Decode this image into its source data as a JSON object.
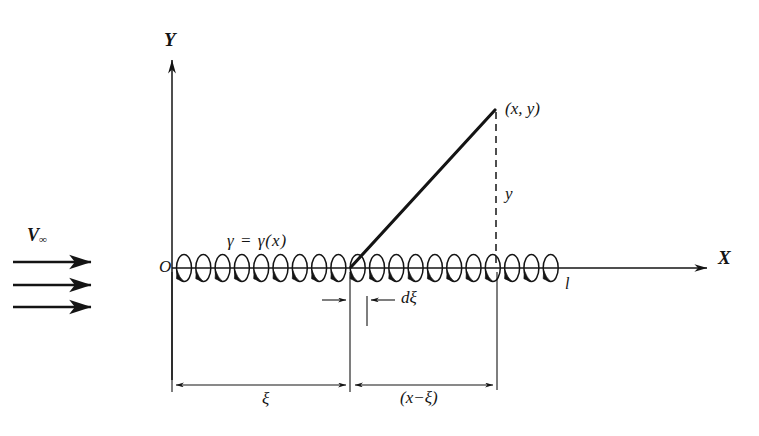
{
  "figure": {
    "type": "vortex-sheet-diagram",
    "background": "#ffffff",
    "ink": "#141414",
    "width": 759,
    "height": 436
  },
  "axes": {
    "x_label": "X",
    "y_label": "Y",
    "origin_label": "O",
    "x_axis": {
      "y": 268,
      "x_start": 172,
      "x_end": 712
    },
    "y_axis": {
      "x": 172,
      "y_start": 57,
      "y_end": 380
    }
  },
  "freestream": {
    "label": "V",
    "subscript": "∞",
    "arrow_count": 3,
    "arrows_y": [
      262,
      285,
      307
    ],
    "x_start": 13,
    "x_end": 97
  },
  "sheet": {
    "strength_label": "γ = γ(x)",
    "length_label": "l",
    "vortex_count": 20,
    "first_center_x": 184,
    "spacing": 19.3,
    "ellipse_rx": 7.5,
    "ellipse_ry": 13.5
  },
  "point": {
    "label": "(x, y)",
    "x": 495,
    "y": 110,
    "height_label": "y",
    "leader_from_x": 351,
    "leader_from_y": 267
  },
  "dimensions": [
    {
      "name": "xi",
      "label": "ξ",
      "from_x": 172,
      "to_x": 350,
      "y": 385
    },
    {
      "name": "x-minus-xi",
      "label": "(x−ξ)",
      "from_x": 351,
      "to_x": 497,
      "y": 385
    },
    {
      "name": "d-xi",
      "label": "dξ",
      "from_x": 350,
      "to_x": 367,
      "y": 300
    }
  ],
  "extension_lines": [
    {
      "x": 172,
      "y1": 268,
      "y2": 392
    },
    {
      "x": 350,
      "y1": 268,
      "y2": 392
    },
    {
      "x": 367,
      "y1": 296,
      "y2": 326
    },
    {
      "x": 497,
      "y1": 268,
      "y2": 390
    }
  ]
}
